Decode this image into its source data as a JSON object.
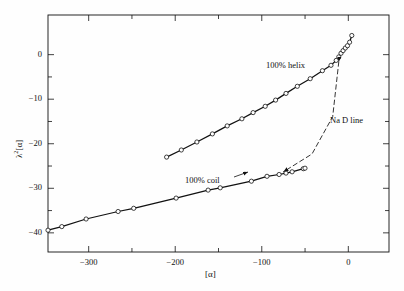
{
  "figure": {
    "background": "#fefefe",
    "ink": "#111111"
  },
  "axes": {
    "x_title": "[α]",
    "y_title_base": "λ",
    "y_title_sup": "2",
    "y_title_tail": "[α]",
    "x_ticks": [
      {
        "value": -300,
        "label": "−300",
        "major": true
      },
      {
        "value": -250,
        "label": "",
        "major": false
      },
      {
        "value": -200,
        "label": "−200",
        "major": true
      },
      {
        "value": -150,
        "label": "",
        "major": false
      },
      {
        "value": -100,
        "label": "−100",
        "major": true
      },
      {
        "value": -50,
        "label": "",
        "major": false
      },
      {
        "value": 0,
        "label": "0",
        "major": true
      }
    ],
    "y_ticks": [
      {
        "value": 0,
        "label": "0",
        "major": true
      },
      {
        "value": -10,
        "label": "−10",
        "major": true
      },
      {
        "value": -20,
        "label": "−20",
        "major": true
      },
      {
        "value": -30,
        "label": "−30",
        "major": true
      },
      {
        "value": -40,
        "label": "−40",
        "major": true
      }
    ],
    "xlim": [
      -347,
      47
    ],
    "ylim": [
      -44.3,
      8.9
    ],
    "frame": {
      "left": 48,
      "right": 389,
      "top": 15,
      "bottom": 252
    },
    "tick_len_major": 6,
    "tick_len_minor": 4,
    "grid": false
  },
  "annotations": [
    {
      "name": "helix-label",
      "text": "100% helix",
      "x": 305,
      "y": 66,
      "anchor": "end"
    },
    {
      "name": "coil-label",
      "text": "100% coil",
      "x": 185,
      "y": 181,
      "anchor": "start"
    },
    {
      "name": "na-d-line-label",
      "text": "Na D line",
      "x": 330,
      "y": 121,
      "anchor": "start"
    }
  ],
  "chart_data": {
    "type": "scatter",
    "title": "",
    "xlabel": "[α]",
    "ylabel": "λ²[α]",
    "xlim": [
      -347,
      47
    ],
    "ylim": [
      -44.3,
      8.9
    ],
    "grid": false,
    "legend": "none (inline curve labels)",
    "series": [
      {
        "name": "100% helix",
        "style": "solid line with open circle markers",
        "marker": "open-circle",
        "x": [
          -210,
          -193,
          -175,
          -157,
          -140,
          -123,
          -110,
          -96,
          -84,
          -72,
          -59,
          -44,
          -30,
          -20,
          -14,
          -11,
          -8.5,
          -6,
          -3.5,
          -1,
          1.5,
          4
        ],
        "y": [
          -23.0,
          -21.4,
          -19.6,
          -17.8,
          -16.0,
          -14.4,
          -13.0,
          -11.6,
          -10.2,
          -8.7,
          -7.1,
          -5.4,
          -3.6,
          -2.4,
          -1.3,
          -0.5,
          0.3,
          0.9,
          1.5,
          2.0,
          2.8,
          4.3
        ]
      },
      {
        "name": "100% coil",
        "style": "solid line with open circle markers",
        "marker": "open-circle",
        "x": [
          -347,
          -331,
          -303,
          -266,
          -248,
          -199,
          -162,
          -148,
          -112,
          -94,
          -80,
          -72,
          -65,
          -52,
          -50
        ],
        "y": [
          -39.4,
          -38.6,
          -36.9,
          -35.2,
          -34.5,
          -32.2,
          -30.4,
          -29.9,
          -28.4,
          -27.3,
          -26.9,
          -26.6,
          -26.3,
          -25.6,
          -25.5
        ]
      },
      {
        "name": "Na D line",
        "style": "dashed connector with arrowheads at both ends",
        "marker": "none",
        "x": [
          -11,
          -18,
          -42,
          -75
        ],
        "y": [
          -1.6,
          -13.9,
          -22.3,
          -26.3
        ]
      }
    ]
  }
}
